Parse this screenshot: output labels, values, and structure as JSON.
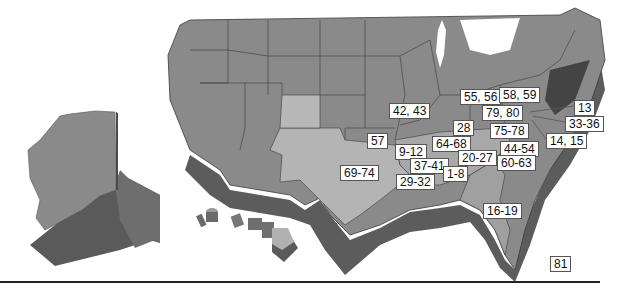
{
  "map": {
    "title": "United States map with numbered region labels",
    "colors": {
      "state_dark": "#8a8a8a",
      "state_light": "#b4b4b4",
      "state_border": "#3a3a3a",
      "extrusion_dark": "#5a5a5a",
      "extrusion_mid": "#707070",
      "label_bg": "#ffffff",
      "label_border": "#555555",
      "rule": "#222222"
    },
    "labels": [
      {
        "id": "ny-ne",
        "text": "55, 56",
        "x": 460,
        "y": 89
      },
      {
        "id": "ny",
        "text": "58, 59",
        "x": 499,
        "y": 87
      },
      {
        "id": "ri",
        "text": "13",
        "x": 574,
        "y": 100
      },
      {
        "id": "wi-il",
        "text": "42, 43",
        "x": 389,
        "y": 103
      },
      {
        "id": "pa",
        "text": "79, 80",
        "x": 482,
        "y": 105
      },
      {
        "id": "nj",
        "text": "33-36",
        "x": 565,
        "y": 116
      },
      {
        "id": "in",
        "text": "28",
        "x": 453,
        "y": 120
      },
      {
        "id": "md",
        "text": "75-78",
        "x": 490,
        "y": 123
      },
      {
        "id": "de",
        "text": "14, 15",
        "x": 546,
        "y": 133
      },
      {
        "id": "ks",
        "text": "57",
        "x": 367,
        "y": 133
      },
      {
        "id": "ky",
        "text": "64-68",
        "x": 432,
        "y": 136
      },
      {
        "id": "mo",
        "text": "9-12",
        "x": 395,
        "y": 144
      },
      {
        "id": "va",
        "text": "44-54",
        "x": 500,
        "y": 141
      },
      {
        "id": "tn",
        "text": "20-27",
        "x": 458,
        "y": 150
      },
      {
        "id": "ar",
        "text": "37-41",
        "x": 410,
        "y": 158
      },
      {
        "id": "nc",
        "text": "60-63",
        "x": 497,
        "y": 155
      },
      {
        "id": "tx",
        "text": "69-74",
        "x": 340,
        "y": 165
      },
      {
        "id": "ms",
        "text": "1-8",
        "x": 443,
        "y": 166
      },
      {
        "id": "la",
        "text": "29-32",
        "x": 396,
        "y": 174
      },
      {
        "id": "fl",
        "text": "16-19",
        "x": 483,
        "y": 203
      },
      {
        "id": "other",
        "text": "81",
        "x": 550,
        "y": 256
      }
    ]
  }
}
